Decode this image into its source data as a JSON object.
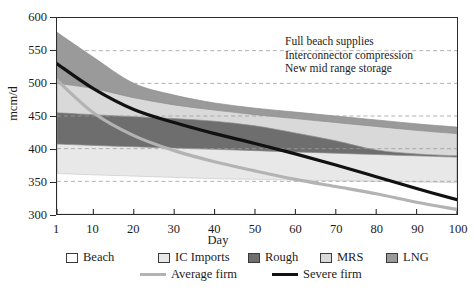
{
  "chart_data": {
    "type": "area",
    "title": "",
    "xlabel": "Day",
    "ylabel": "mcm/d",
    "xlim": [
      1,
      100
    ],
    "ylim": [
      300,
      600
    ],
    "grid": true,
    "legend_position": "bottom",
    "x_ticks": [
      "1",
      "10",
      "20",
      "30",
      "40",
      "50",
      "60",
      "70",
      "80",
      "90",
      "100"
    ],
    "x_tick_values": [
      1,
      10,
      20,
      30,
      40,
      50,
      60,
      70,
      80,
      90,
      100
    ],
    "y_ticks": [
      "300",
      "350",
      "400",
      "450",
      "500",
      "550",
      "600"
    ],
    "y_tick_values": [
      300,
      350,
      400,
      450,
      500,
      550,
      600
    ],
    "x": [
      1,
      10,
      20,
      30,
      40,
      50,
      60,
      70,
      80,
      90,
      100
    ],
    "stacked_series": [
      {
        "name": "Beach",
        "color": "#ffffff",
        "cumulative_top": [
          362,
          360,
          358,
          356,
          354,
          353,
          352,
          351,
          350,
          349,
          348
        ]
      },
      {
        "name": "IC Imports",
        "color": "#e8e8e8",
        "cumulative_top": [
          407,
          405,
          403,
          401,
          399,
          397,
          395,
          393,
          391,
          389,
          387
        ]
      },
      {
        "name": "Rough",
        "color": "#6e6e6e",
        "cumulative_top": [
          455,
          452,
          449,
          446,
          442,
          435,
          424,
          412,
          398,
          392,
          389
        ]
      },
      {
        "name": "MRS",
        "color": "#d9d9d9",
        "cumulative_top": [
          500,
          492,
          478,
          467,
          459,
          452,
          446,
          440,
          434,
          428,
          423
        ]
      },
      {
        "name": "LNG",
        "color": "#9a9a9a",
        "cumulative_top": [
          578,
          540,
          500,
          482,
          470,
          462,
          456,
          450,
          444,
          438,
          433
        ]
      }
    ],
    "line_series": [
      {
        "name": "Average firm",
        "color": "#b3b3b3",
        "width": 3.2,
        "values": [
          505,
          455,
          420,
          397,
          380,
          366,
          353,
          342,
          331,
          318,
          307
        ]
      },
      {
        "name": "Severe firm",
        "color": "#111111",
        "width": 3.2,
        "values": [
          530,
          492,
          460,
          440,
          423,
          408,
          392,
          375,
          357,
          339,
          322
        ]
      }
    ],
    "annotations": [
      "Full beach supplies",
      "Interconnector compression",
      "New mid range storage"
    ],
    "legend": {
      "swatches": [
        {
          "label": "Beach",
          "color": "#ffffff"
        },
        {
          "label": "IC Imports",
          "color": "#e8e8e8"
        },
        {
          "label": "Rough",
          "color": "#6e6e6e"
        },
        {
          "label": "MRS",
          "color": "#d9d9d9"
        },
        {
          "label": "LNG",
          "color": "#9a9a9a"
        }
      ],
      "lines": [
        {
          "label": "Average firm",
          "color": "#b3b3b3"
        },
        {
          "label": "Severe firm",
          "color": "#111111"
        }
      ]
    }
  }
}
